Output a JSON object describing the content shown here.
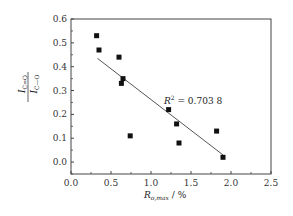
{
  "chart_data": {
    "type": "scatter",
    "title": "",
    "xlabel": "R o,max / %",
    "xlabel_main": "R",
    "xlabel_sub": "o,max",
    "xlabel_unit": " / %",
    "ylabel": "I C=O / I C—O",
    "ylabel_numerator": "I",
    "ylabel_numerator_sub": "C=O",
    "ylabel_denominator": "I",
    "ylabel_denominator_sub": "C—O",
    "xlim": [
      0.0,
      2.5
    ],
    "ylim": [
      -0.05,
      0.6
    ],
    "xticks": [
      "0.0",
      "0.5",
      "1.0",
      "1.5",
      "2.0",
      "2.5"
    ],
    "yticks": [
      "0.0",
      "0.1",
      "0.2",
      "0.3",
      "0.4",
      "0.5",
      "0.6"
    ],
    "grid": false,
    "legend": null,
    "series": [
      {
        "name": "data",
        "marker": "square",
        "color": "#111111",
        "x": [
          0.32,
          0.35,
          0.6,
          0.65,
          0.63,
          0.74,
          1.22,
          1.32,
          1.35,
          1.82,
          1.9
        ],
        "y": [
          0.53,
          0.47,
          0.44,
          0.35,
          0.33,
          0.11,
          0.22,
          0.16,
          0.08,
          0.13,
          0.02
        ]
      },
      {
        "name": "linear fit",
        "type": "line",
        "color": "#555555",
        "x": [
          0.33,
          1.9
        ],
        "y": [
          0.435,
          0.03
        ]
      }
    ],
    "annotations": [
      {
        "text": "R² = 0.703 8",
        "x": 1.15,
        "y": 0.32
      }
    ]
  },
  "annotation": {
    "r2_label": "R",
    "r2_sup": "2",
    "r2_value": " = 0.703 8"
  }
}
